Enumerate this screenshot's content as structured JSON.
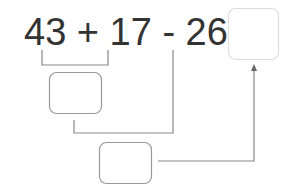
{
  "equation": {
    "text": "43 + 17 - 26 =",
    "terms": [
      "43",
      "+",
      "17",
      "-",
      "26",
      "="
    ]
  },
  "boxes": [
    {
      "id": "intermediate-sum",
      "value": ""
    },
    {
      "id": "intermediate-difference",
      "value": ""
    },
    {
      "id": "answer",
      "value": ""
    }
  ],
  "colors": {
    "text": "#333333",
    "line": "#888888",
    "box_border": "#999999",
    "answer_border": "#dddddd"
  }
}
